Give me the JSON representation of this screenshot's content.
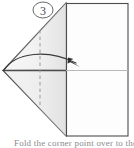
{
  "figure": {
    "step_number": "3",
    "caption": "Fold the corner point over to the right."
  },
  "colors": {
    "outline": "#4d4d4d",
    "outline_light": "#9a9a9a",
    "fill_paper": "#fdfdfd",
    "fill_flap": "#f2f2f2",
    "fill_flap_lower": "#ececec",
    "arrow": "#3a3a3a",
    "dash": "#9a9a9a",
    "crease_light": "#b9b9b9",
    "caption_text": "#8a8a8a",
    "background": "#ffffff"
  },
  "geometry": {
    "sheet_rect": {
      "x": 66,
      "y": 3,
      "width": 62,
      "height": 133
    },
    "flap_apex_top": {
      "x": 66,
      "y": 3
    },
    "flap_point_left": {
      "x": 3,
      "y": 71
    },
    "flap_apex_bottom": {
      "x": 66,
      "y": 136
    },
    "fold_line_dashed": {
      "x": 40,
      "y_top": 30,
      "y_bottom": 105
    },
    "crease_horizontal": {
      "y": 70,
      "x_start": 3,
      "x_end": 128
    },
    "motion_arrow": {
      "start": {
        "x": 4,
        "y": 70
      },
      "peak": {
        "x": 40,
        "y": 55
      },
      "end": {
        "x": 79,
        "y": 66
      }
    },
    "step_badge": {
      "cx": 43,
      "cy": 10,
      "rx": 10,
      "ry": 8
    }
  },
  "labels": {
    "step_badge_name": "step-number-badge",
    "arrow_name": "fold-direction-arrow",
    "dash_name": "fold-crease-dashed-line"
  }
}
